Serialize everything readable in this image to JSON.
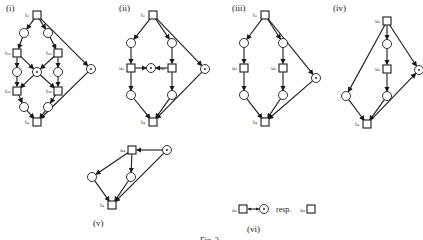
{
  "figure": {
    "caption": "Fig. 3",
    "panels": [
      {
        "id": "i",
        "label": "(i)",
        "label_pos": [
          6,
          11
        ],
        "transitions": [
          {
            "id": "t1",
            "label": "t₁",
            "x": 37,
            "y": 15
          },
          {
            "id": "t11",
            "label": "t₁₁",
            "x": 17,
            "y": 53
          },
          {
            "id": "t21",
            "label": "t₂₁",
            "x": 58,
            "y": 53
          },
          {
            "id": "t12",
            "label": "t₁₂",
            "x": 17,
            "y": 91
          },
          {
            "id": "t22",
            "label": "t₂₂",
            "x": 58,
            "y": 91
          },
          {
            "id": "t4",
            "label": "t₄",
            "x": 37,
            "y": 122
          }
        ],
        "places": [
          {
            "x": 24,
            "y": 33,
            "token": false
          },
          {
            "x": 48,
            "y": 33,
            "token": false
          },
          {
            "x": 17,
            "y": 72,
            "token": false
          },
          {
            "x": 58,
            "y": 72,
            "token": false
          },
          {
            "x": 37,
            "y": 72,
            "token": true
          },
          {
            "x": 24,
            "y": 107,
            "token": false
          },
          {
            "x": 48,
            "y": 107,
            "token": false
          },
          {
            "x": 91,
            "y": 69,
            "token": true
          }
        ],
        "arcs": [
          [
            37,
            15,
            24,
            33
          ],
          [
            37,
            15,
            48,
            33
          ],
          [
            24,
            33,
            17,
            53
          ],
          [
            48,
            33,
            58,
            53
          ],
          [
            17,
            53,
            17,
            72
          ],
          [
            58,
            53,
            58,
            72
          ],
          [
            17,
            72,
            17,
            91
          ],
          [
            58,
            72,
            58,
            91
          ],
          [
            17,
            53,
            37,
            72
          ],
          [
            58,
            53,
            37,
            72
          ],
          [
            37,
            72,
            17,
            91
          ],
          [
            37,
            72,
            58,
            91
          ],
          [
            17,
            91,
            24,
            107
          ],
          [
            58,
            91,
            48,
            107
          ],
          [
            24,
            107,
            37,
            122
          ],
          [
            48,
            107,
            37,
            122
          ],
          [
            37,
            15,
            91,
            69
          ],
          [
            91,
            69,
            37,
            122
          ]
        ]
      },
      {
        "id": "ii",
        "label": "(ii)",
        "label_pos": [
          119,
          11
        ],
        "transitions": [
          {
            "id": "t1",
            "label": "t₁",
            "x": 153,
            "y": 15
          },
          {
            "id": "u1",
            "label": "u₁",
            "x": 131,
            "y": 68
          },
          {
            "id": "u2",
            "label": "u₂",
            "x": 172,
            "y": 68
          },
          {
            "id": "t4",
            "label": "t₄",
            "x": 153,
            "y": 122
          }
        ],
        "places": [
          {
            "x": 131,
            "y": 43,
            "token": false
          },
          {
            "x": 172,
            "y": 43,
            "token": false
          },
          {
            "x": 151,
            "y": 68,
            "token": true
          },
          {
            "x": 131,
            "y": 95,
            "token": false
          },
          {
            "x": 172,
            "y": 95,
            "token": false
          },
          {
            "x": 205,
            "y": 69,
            "token": true
          }
        ],
        "arcs": [
          [
            153,
            15,
            131,
            43
          ],
          [
            153,
            15,
            172,
            43
          ],
          [
            131,
            43,
            131,
            68
          ],
          [
            172,
            43,
            172,
            68
          ],
          [
            131,
            68,
            151,
            68
          ],
          [
            172,
            68,
            151,
            68
          ],
          [
            131,
            68,
            131,
            95
          ],
          [
            172,
            68,
            172,
            95
          ],
          [
            131,
            95,
            153,
            122
          ],
          [
            172,
            95,
            153,
            122
          ],
          [
            153,
            15,
            205,
            69
          ],
          [
            205,
            69,
            153,
            122
          ]
        ]
      },
      {
        "id": "iii",
        "label": "(iii)",
        "label_pos": [
          232,
          11
        ],
        "transitions": [
          {
            "id": "t1",
            "label": "t₁",
            "x": 265,
            "y": 15
          },
          {
            "id": "u1",
            "label": "u₁",
            "x": 244,
            "y": 68
          },
          {
            "id": "u2",
            "label": "u₂",
            "x": 283,
            "y": 68
          },
          {
            "id": "t4",
            "label": "t₄",
            "x": 265,
            "y": 122
          }
        ],
        "places": [
          {
            "x": 244,
            "y": 43,
            "token": false
          },
          {
            "x": 283,
            "y": 43,
            "token": false
          },
          {
            "x": 244,
            "y": 95,
            "token": false
          },
          {
            "x": 283,
            "y": 95,
            "token": false
          },
          {
            "x": 316,
            "y": 78,
            "token": true
          }
        ],
        "arcs": [
          [
            265,
            15,
            244,
            43
          ],
          [
            265,
            15,
            283,
            43
          ],
          [
            244,
            43,
            244,
            68
          ],
          [
            283,
            43,
            283,
            68
          ],
          [
            244,
            68,
            244,
            95
          ],
          [
            283,
            68,
            283,
            95
          ],
          [
            244,
            95,
            265,
            122
          ],
          [
            283,
            95,
            265,
            122
          ],
          [
            265,
            15,
            316,
            78
          ],
          [
            316,
            78,
            265,
            122
          ]
        ]
      },
      {
        "id": "iv",
        "label": "(iv)",
        "label_pos": [
          333,
          11
        ],
        "transitions": [
          {
            "id": "u2",
            "label": "u₂",
            "x": 387,
            "y": 21
          },
          {
            "id": "u2b",
            "label": "u₂",
            "x": 387,
            "y": 69
          },
          {
            "id": "t4",
            "label": "t₄",
            "x": 367,
            "y": 124
          }
        ],
        "places": [
          {
            "x": 387,
            "y": 44,
            "token": false
          },
          {
            "x": 346,
            "y": 96,
            "token": false
          },
          {
            "x": 387,
            "y": 96,
            "token": false
          },
          {
            "x": 419,
            "y": 70,
            "token": true
          }
        ],
        "arcs": [
          [
            387,
            21,
            387,
            44
          ],
          [
            387,
            44,
            387,
            69
          ],
          [
            387,
            69,
            387,
            96
          ],
          [
            387,
            21,
            346,
            96
          ],
          [
            346,
            96,
            367,
            124
          ],
          [
            387,
            96,
            367,
            124
          ],
          [
            387,
            21,
            419,
            70
          ],
          [
            367,
            124,
            419,
            70
          ]
        ]
      },
      {
        "id": "v",
        "label": "(v)",
        "label_pos": [
          93,
          226
        ],
        "transitions": [
          {
            "id": "u4",
            "label": "u₄",
            "x": 132,
            "y": 150
          },
          {
            "id": "t4",
            "label": "t₄",
            "x": 112,
            "y": 205
          }
        ],
        "places": [
          {
            "x": 92,
            "y": 177,
            "token": false
          },
          {
            "x": 131,
            "y": 177,
            "token": false
          },
          {
            "x": 167,
            "y": 150,
            "token": true
          }
        ],
        "arcs": [
          [
            167,
            150,
            132,
            150
          ],
          [
            132,
            150,
            92,
            177
          ],
          [
            132,
            150,
            131,
            177
          ],
          [
            92,
            177,
            112,
            205
          ],
          [
            131,
            177,
            112,
            205
          ],
          [
            167,
            150,
            112,
            205
          ]
        ]
      }
    ],
    "legend": {
      "id": "vi",
      "label": "(vi)",
      "label_pos": [
        247,
        232
      ],
      "left_transition_label": "u₁",
      "connector": "bidirectional-arc",
      "resp_text": "resp.",
      "right_transition_label": "u₂"
    }
  }
}
